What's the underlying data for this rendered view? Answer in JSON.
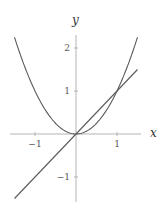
{
  "chart_data": {
    "type": "line",
    "title": "",
    "xlabel": "x",
    "ylabel": "y",
    "xlim": [
      -1.5,
      1.5
    ],
    "ylim": [
      -1.5,
      2.25
    ],
    "grid": false,
    "legend": null,
    "x_ticks": [
      -1,
      1
    ],
    "x_tick_labels": [
      "−1",
      "1"
    ],
    "y_ticks": [
      -1,
      1,
      2
    ],
    "y_tick_labels": [
      "−1",
      "1",
      "2"
    ],
    "series": [
      {
        "name": "y = x^2",
        "x": [
          -1.5,
          -1.25,
          -1.0,
          -0.75,
          -0.5,
          -0.25,
          0,
          0.25,
          0.5,
          0.75,
          1.0,
          1.25,
          1.5
        ],
        "y": [
          2.25,
          1.5625,
          1.0,
          0.5625,
          0.25,
          0.0625,
          0,
          0.0625,
          0.25,
          0.5625,
          1.0,
          1.5625,
          2.25
        ],
        "color": "#5a5a5a"
      },
      {
        "name": "y = x",
        "x": [
          -1.5,
          1.5
        ],
        "y": [
          -1.5,
          1.5
        ],
        "color": "#5a5a5a"
      }
    ],
    "annotations": []
  },
  "labels": {
    "x_axis": "x",
    "y_axis": "y",
    "x_tick_neg1": "−1",
    "x_tick_1": "1",
    "y_tick_neg1": "−1",
    "y_tick_1": "1",
    "y_tick_2": "2"
  }
}
